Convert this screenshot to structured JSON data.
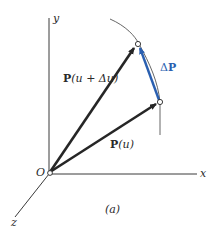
{
  "figure": {
    "caption": "(a)",
    "axes": {
      "x_label": "x",
      "y_label": "y",
      "z_label": "z",
      "origin_label": "O"
    },
    "vectors": {
      "p_u": {
        "bold": "P",
        "arg": "(u)"
      },
      "p_u_du": {
        "bold": "P",
        "arg": "(u + Δu)"
      },
      "delta_p": {
        "prefix": "Δ",
        "bold": "P"
      }
    },
    "colors": {
      "vector": "#262626",
      "delta": "#2a5fb0",
      "axis": "#3a3a3a",
      "curve": "#555555"
    }
  }
}
